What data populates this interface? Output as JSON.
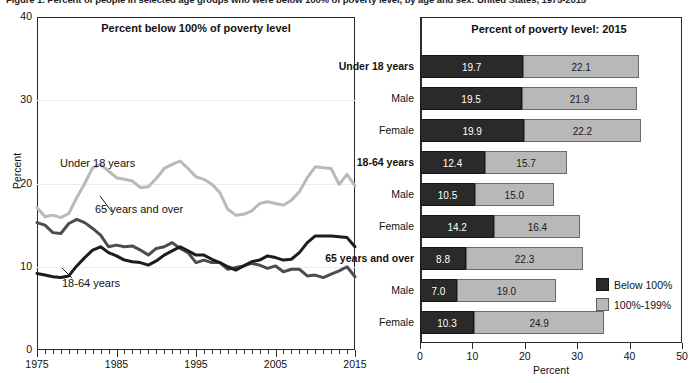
{
  "figure": {
    "title": "Figure 1. Percent of people in selected age groups who were below 100% of poverty level, by age and sex: United States, 1975-2015"
  },
  "line_chart": {
    "panel_title": "Percent below 100% of poverty level",
    "ylabel": "Percent",
    "yticks": [
      "0",
      "10",
      "20",
      "30",
      "40"
    ],
    "xticks": [
      "1975",
      "1985",
      "1995",
      "2005",
      "2015"
    ],
    "series_labels": {
      "under18": "Under 18 years",
      "age65": "65 years and over",
      "age1864": "18-64 years"
    },
    "colors": {
      "under18": "#b9b9b9",
      "age65": "#4d4d4d",
      "age1864": "#1c1c1c"
    }
  },
  "bar_chart": {
    "panel_title": "Percent of poverty level: 2015",
    "xlabel": "Percent",
    "xticks": [
      "0",
      "10",
      "20",
      "30",
      "40",
      "50"
    ],
    "legend": [
      {
        "label": "Below 100%",
        "color": "#2a2a2a"
      },
      {
        "label": "100%-199%",
        "color": "#b8b8b8"
      }
    ],
    "rows": [
      {
        "category": "Under 18 years",
        "group": true,
        "below": 19.7,
        "between": 22.1
      },
      {
        "category": "Male",
        "group": false,
        "below": 19.5,
        "between": 21.9
      },
      {
        "category": "Female",
        "group": false,
        "below": 19.9,
        "between": 22.2
      },
      {
        "category": "18-64 years",
        "group": true,
        "below": 12.4,
        "between": 15.7
      },
      {
        "category": "Male",
        "group": false,
        "below": 10.5,
        "between": 15.0
      },
      {
        "category": "Female",
        "group": false,
        "below": 14.2,
        "between": 16.4
      },
      {
        "category": "65 years and over",
        "group": true,
        "below": 8.8,
        "between": 22.3
      },
      {
        "category": "Male",
        "group": false,
        "below": 7.0,
        "between": 19.0
      },
      {
        "category": "Female",
        "group": false,
        "below": 10.3,
        "between": 24.9
      }
    ]
  },
  "chart_data": [
    {
      "type": "line",
      "title": "Percent below 100% of poverty level",
      "xlabel": "",
      "ylabel": "Percent",
      "xlim": [
        1975,
        2015
      ],
      "ylim": [
        0,
        40
      ],
      "yticks": [
        0,
        10,
        20,
        30,
        40
      ],
      "xticks": [
        1975,
        1985,
        1995,
        2005,
        2015
      ],
      "grid": true,
      "legend": "inline-labels",
      "x": [
        1975,
        1976,
        1977,
        1978,
        1979,
        1980,
        1981,
        1982,
        1983,
        1984,
        1985,
        1986,
        1987,
        1988,
        1989,
        1990,
        1991,
        1992,
        1993,
        1994,
        1995,
        1996,
        1997,
        1998,
        1999,
        2000,
        2001,
        2002,
        2003,
        2004,
        2005,
        2006,
        2007,
        2008,
        2009,
        2010,
        2011,
        2012,
        2013,
        2014,
        2015
      ],
      "series": [
        {
          "name": "Under 18 years",
          "color": "#b9b9b9",
          "values": [
            17.1,
            16.0,
            16.2,
            15.9,
            16.4,
            18.3,
            20.0,
            21.9,
            22.3,
            21.5,
            20.7,
            20.5,
            20.3,
            19.5,
            19.6,
            20.6,
            21.8,
            22.3,
            22.7,
            21.8,
            20.8,
            20.5,
            19.9,
            18.9,
            16.9,
            16.2,
            16.3,
            16.7,
            17.6,
            17.8,
            17.6,
            17.4,
            18.0,
            19.0,
            20.7,
            22.0,
            21.9,
            21.8,
            19.9,
            21.1,
            19.7
          ]
        },
        {
          "name": "65 years and over",
          "color": "#4d4d4d",
          "values": [
            15.3,
            15.0,
            14.1,
            14.0,
            15.2,
            15.7,
            15.3,
            14.6,
            13.8,
            12.4,
            12.6,
            12.4,
            12.5,
            12.0,
            11.4,
            12.2,
            12.4,
            12.9,
            12.2,
            11.7,
            10.5,
            10.8,
            10.5,
            10.5,
            9.7,
            9.9,
            10.1,
            10.4,
            10.2,
            9.8,
            10.1,
            9.4,
            9.7,
            9.7,
            8.9,
            9.0,
            8.7,
            9.1,
            9.5,
            10.0,
            8.8
          ]
        },
        {
          "name": "18-64 years",
          "color": "#1c1c1c",
          "values": [
            9.2,
            9.0,
            8.8,
            8.7,
            8.9,
            10.1,
            11.1,
            12.0,
            12.4,
            11.7,
            11.3,
            10.8,
            10.6,
            10.5,
            10.2,
            10.7,
            11.4,
            11.9,
            12.4,
            11.9,
            11.4,
            11.4,
            10.9,
            10.5,
            10.0,
            9.6,
            10.1,
            10.6,
            10.8,
            11.3,
            11.1,
            10.8,
            10.9,
            11.7,
            12.9,
            13.7,
            13.7,
            13.7,
            13.6,
            13.5,
            12.4
          ]
        }
      ]
    },
    {
      "type": "bar",
      "orientation": "horizontal",
      "stacked": true,
      "title": "Percent of poverty level: 2015",
      "xlabel": "Percent",
      "ylabel": "",
      "xlim": [
        0,
        50
      ],
      "xticks": [
        0,
        10,
        20,
        30,
        40,
        50
      ],
      "categories": [
        "Under 18 years",
        "Male",
        "Female",
        "18-64 years",
        "Male",
        "Female",
        "65 years and over",
        "Male",
        "Female"
      ],
      "series": [
        {
          "name": "Below 100%",
          "color": "#2a2a2a",
          "values": [
            19.7,
            19.5,
            19.9,
            12.4,
            10.5,
            14.2,
            8.8,
            7.0,
            10.3
          ]
        },
        {
          "name": "100%-199%",
          "color": "#b8b8b8",
          "values": [
            22.1,
            21.9,
            22.2,
            15.7,
            15.0,
            16.4,
            22.3,
            19.0,
            24.9
          ]
        }
      ]
    }
  ]
}
